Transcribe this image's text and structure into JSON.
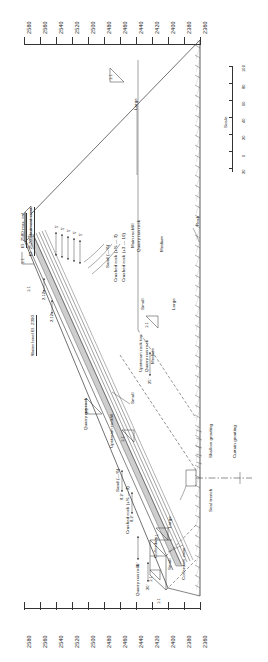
{
  "axes": {
    "top": {
      "name": "elevation-scale-top",
      "labels": [
        "2580",
        "2560",
        "2540",
        "2520",
        "2500",
        "2480",
        "2460",
        "2440",
        "2420",
        "2400",
        "2380",
        "2360"
      ]
    },
    "bottom": {
      "name": "elevation-scale-bottom",
      "labels": [
        "2580",
        "2560",
        "2540",
        "2520",
        "2500",
        "2480",
        "2460",
        "2440",
        "2420",
        "2400",
        "2380",
        "2360"
      ]
    }
  },
  "scale_bar": {
    "label": "Scale",
    "ticks": [
      "100",
      "80",
      "60",
      "40",
      "20",
      "0",
      "20"
    ]
  },
  "elevations": {
    "max_rwl": "El. 2580 max. rwl",
    "abutment_crest": "El. 2570 abutment crest",
    "water_level": "Water level El. 2390"
  },
  "zones": {
    "sand": "Sand (—⅜)",
    "crushed_rock_1": "Crushed rock (+⅜ — 3)",
    "crushed_rock_2": "Crushed rock (+3 — 10)",
    "main_rockfill": "Main rockfill",
    "quarry_run_rock": "Quarry run rock",
    "upstream_rockfill": "Upstream rockfill",
    "upstream_rock_toe": "Upstream rock toe",
    "quarry_run_rock_2": "Quarry run rock",
    "quarry_run_rock_3": "Quarry run rock",
    "quarry_run_rock_4": "Quarry run rock",
    "cofferdam_zone": "Cofferdam zone",
    "cofferdam": "Cofferdam",
    "rock": "Rock"
  },
  "gradation": {
    "large_top": "Large",
    "medium_upper": "Medium",
    "large_mid": "Large",
    "small_mid": "Small",
    "medium_lower": "Medium",
    "small_lower": "Small",
    "small_coffer": "Small",
    "large_coffer": "Large"
  },
  "treatment": {
    "shallow_grouting": "Shallow grouting",
    "curtain_grouting": "Curtain grouting",
    "seal_trench": "Seal trench"
  },
  "dimensions": {
    "d_5a": "5'",
    "d_5b": "5'",
    "d_5c": "5'",
    "d_5d": "5'",
    "d_5e": "5'",
    "d_212a": "2.12'",
    "d_212b": "2.12'",
    "d_82a": "8.2'",
    "d_82b": "8.2'",
    "d_25": "25'",
    "d_30": "30'",
    "d_20": "20'"
  },
  "slopes": {
    "s_crest": "1:1",
    "s_left_upper": "1:1",
    "s_left_lower": "1:1",
    "s_mid": "1:1",
    "s_small": "1:1",
    "s_core": "2:1",
    "s_coffer_a": "1:1",
    "s_coffer_b": "1:1",
    "s_coffer_c": "1:1",
    "s_toe": "1:1",
    "s_base": "1:1"
  },
  "colors": {
    "ink": "#222222",
    "rule": "#333333",
    "paper": "#ffffff",
    "zone_fill": "#bfbfbf"
  }
}
